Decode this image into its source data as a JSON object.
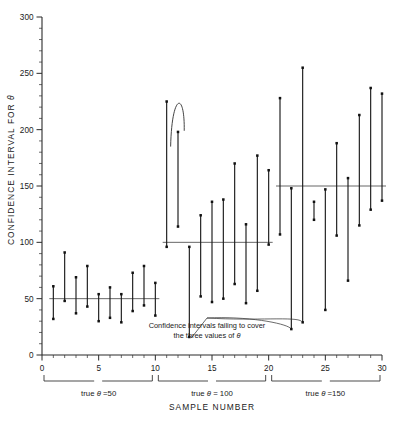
{
  "chart_data": {
    "type": "scatter",
    "title": "",
    "xlabel": "SAMPLE NUMBER",
    "ylabel": "CONFIDENCE INTERVAL FOR θ",
    "xlim": [
      0,
      30
    ],
    "ylim": [
      0,
      300
    ],
    "x_major_ticks": [
      0,
      5,
      10,
      15,
      20,
      25,
      30
    ],
    "x_tick_labels": [
      "0",
      "5",
      "10",
      "15",
      "20",
      "25",
      "30"
    ],
    "x_minor_step": 1,
    "y_major_ticks": [
      0,
      50,
      100,
      150,
      200,
      250,
      300
    ],
    "y_tick_labels": [
      "0",
      "50",
      "100",
      "150",
      "200",
      "250",
      "300"
    ],
    "y_minor_step": 10,
    "grid": false,
    "legend": null,
    "reference_lines": [
      {
        "label": "true θ =50",
        "value": 50,
        "x_from": 1,
        "x_to": 10
      },
      {
        "label": "true θ = 100",
        "value": 100,
        "x_from": 11,
        "x_to": 20
      },
      {
        "label": "true θ =150",
        "value": 150,
        "x_from": 21,
        "x_to": 30
      }
    ],
    "series": [
      {
        "name": "confidence intervals",
        "marker": "filled-square",
        "points": [
          {
            "sample": 1,
            "lower": 32,
            "upper": 61,
            "covers": true
          },
          {
            "sample": 2,
            "lower": 48,
            "upper": 91,
            "covers": true
          },
          {
            "sample": 3,
            "lower": 37,
            "upper": 69,
            "covers": true
          },
          {
            "sample": 4,
            "lower": 43,
            "upper": 79,
            "covers": true
          },
          {
            "sample": 5,
            "lower": 30,
            "upper": 54,
            "covers": true
          },
          {
            "sample": 6,
            "lower": 33,
            "upper": 60,
            "covers": true
          },
          {
            "sample": 7,
            "lower": 29,
            "upper": 54,
            "covers": true
          },
          {
            "sample": 8,
            "lower": 39,
            "upper": 73,
            "covers": true
          },
          {
            "sample": 9,
            "lower": 44,
            "upper": 79,
            "covers": true
          },
          {
            "sample": 10,
            "lower": 35,
            "upper": 64,
            "covers": true
          },
          {
            "sample": 11,
            "lower": 96,
            "upper": 225,
            "covers": true
          },
          {
            "sample": 12,
            "lower": 114,
            "upper": 198,
            "covers": false
          },
          {
            "sample": 13,
            "lower": 16,
            "upper": 96,
            "covers": false
          },
          {
            "sample": 14,
            "lower": 52,
            "upper": 124,
            "covers": true
          },
          {
            "sample": 15,
            "lower": 47,
            "upper": 136,
            "covers": true
          },
          {
            "sample": 16,
            "lower": 50,
            "upper": 138,
            "covers": true
          },
          {
            "sample": 17,
            "lower": 63,
            "upper": 170,
            "covers": true
          },
          {
            "sample": 18,
            "lower": 46,
            "upper": 116,
            "covers": true
          },
          {
            "sample": 19,
            "lower": 57,
            "upper": 177,
            "covers": true
          },
          {
            "sample": 20,
            "lower": 98,
            "upper": 164,
            "covers": true
          },
          {
            "sample": 21,
            "lower": 107,
            "upper": 228,
            "covers": true
          },
          {
            "sample": 22,
            "lower": 23,
            "upper": 148,
            "covers": false
          },
          {
            "sample": 23,
            "lower": 29,
            "upper": 255,
            "covers": false
          },
          {
            "sample": 24,
            "lower": 120,
            "upper": 136,
            "covers": false
          },
          {
            "sample": 25,
            "lower": 40,
            "upper": 147,
            "covers": true
          },
          {
            "sample": 26,
            "lower": 106,
            "upper": 188,
            "covers": true
          },
          {
            "sample": 27,
            "lower": 66,
            "upper": 157,
            "covers": true
          },
          {
            "sample": 28,
            "lower": 115,
            "upper": 213,
            "covers": true
          },
          {
            "sample": 29,
            "lower": 129,
            "upper": 237,
            "covers": true
          },
          {
            "sample": 30,
            "lower": 137,
            "upper": 232,
            "covers": true
          }
        ]
      }
    ],
    "annotations": [
      {
        "text_line_1": "Confidence intervals failing to cover",
        "text_line_2": "the three values of θ",
        "points_to_samples": [
          13,
          22,
          23
        ]
      }
    ]
  },
  "axes": {
    "ylabel": "CONFIDENCE INTERVAL FOR θ",
    "ylabel_parts": {
      "main": "CONFIDENCE  INTERVAL  FOR",
      "symbol": "θ"
    },
    "xlabel": "SAMPLE  NUMBER",
    "y_tick_labels": [
      "0",
      "50",
      "100",
      "150",
      "200",
      "250",
      "300"
    ],
    "x_tick_labels": [
      "0",
      "5",
      "10",
      "15",
      "20",
      "25",
      "30"
    ]
  },
  "groups": [
    {
      "name": "group-theta-50",
      "prefix": "true ",
      "symbol": "θ",
      "suffix": " =50"
    },
    {
      "name": "group-theta-100",
      "prefix": "true ",
      "symbol": "θ",
      "suffix": " = 100"
    },
    {
      "name": "group-theta-150",
      "prefix": "true ",
      "symbol": "θ",
      "suffix": " =150"
    }
  ],
  "annotation": {
    "line1": "Confidence intervals failing to cover",
    "line2_prefix": "the three values of ",
    "line2_symbol": "θ"
  },
  "colors": {
    "background": "#ffffff",
    "ink": "#1a1a1a",
    "axis": "#2b2b2b",
    "reference": "#555555",
    "leader": "#3a3a3a"
  }
}
